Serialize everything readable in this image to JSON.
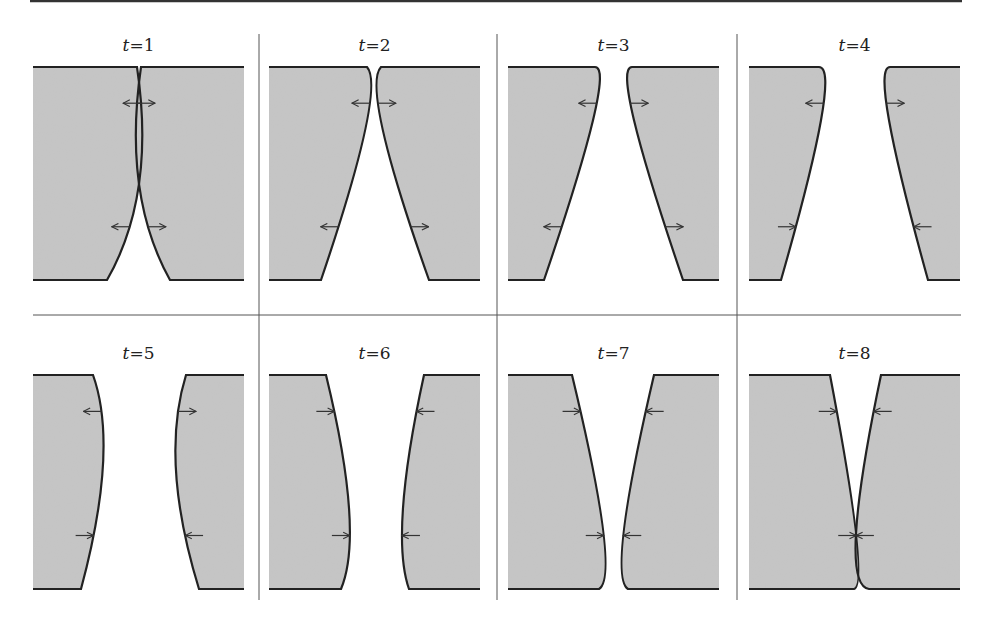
{
  "figure": {
    "colors": {
      "fill": "#c6c6c6",
      "stroke": "#222222",
      "rule": "#333333",
      "divider": "#555555"
    },
    "top_rule": {
      "x1": 30,
      "x2": 962,
      "y": 1
    },
    "h_divider": {
      "x1": 33,
      "x2": 961,
      "y": 315
    },
    "v_dividers": [
      {
        "x": 259,
        "y1": 34,
        "y2": 600
      },
      {
        "x": 497,
        "y1": 34,
        "y2": 600
      },
      {
        "x": 737,
        "y1": 34,
        "y2": 600
      }
    ],
    "panels": [
      {
        "label_var": "t",
        "label_val": "1",
        "col": 0,
        "row": 0,
        "left": {
          "top": 104,
          "mid": 106,
          "bot": 74,
          "midy": 0.55
        },
        "right": {
          "top": 108,
          "mid": 106,
          "bot": 137,
          "midy": 0.55
        },
        "arrows": [
          {
            "x": 106,
            "fy": 0.17,
            "l": "out",
            "r": "out"
          },
          {
            "fy": 0.75,
            "l": "out",
            "r": "out"
          }
        ]
      },
      {
        "label_var": "t",
        "label_val": "2",
        "col": 1,
        "row": 0,
        "left": {
          "top": 98,
          "mid": 96,
          "bot": 52,
          "midy": 0.3
        },
        "right": {
          "top": 112,
          "mid": 114,
          "bot": 160,
          "midy": 0.3
        },
        "arrows": [
          {
            "fy": 0.17,
            "l": "out",
            "r": "out"
          },
          {
            "fy": 0.75,
            "l": "out",
            "r": "out"
          }
        ]
      },
      {
        "label_var": "t",
        "label_val": "3",
        "col": 2,
        "row": 0,
        "left": {
          "top": 87,
          "mid": 85,
          "bot": 36,
          "midy": 0.25
        },
        "right": {
          "top": 124,
          "mid": 126,
          "bot": 175,
          "midy": 0.25
        },
        "arrows": [
          {
            "fy": 0.17,
            "l": "out",
            "r": "out"
          },
          {
            "fy": 0.75,
            "l": "out",
            "r": "out"
          }
        ]
      },
      {
        "label_var": "t",
        "label_val": "4",
        "col": 3,
        "row": 0,
        "left": {
          "top": 70,
          "mid": 72,
          "bot": 32,
          "midy": 0.25
        },
        "right": {
          "top": 141,
          "mid": 140,
          "bot": 179,
          "midy": 0.25
        },
        "arrows": [
          {
            "fy": 0.17,
            "l": "out",
            "r": "out"
          },
          {
            "fy": 0.75,
            "l": "in",
            "r": "in"
          }
        ]
      },
      {
        "label_var": "t",
        "label_val": "5",
        "col": 0,
        "row": 1,
        "left": {
          "top": 60,
          "mid": 70,
          "bot": 48,
          "midy": 0.42
        },
        "right": {
          "top": 153,
          "mid": 143,
          "bot": 166,
          "midy": 0.45
        },
        "arrows": [
          {
            "fy": 0.17,
            "l": "out",
            "r": "out"
          },
          {
            "fy": 0.75,
            "l": "in",
            "r": "in"
          }
        ]
      },
      {
        "label_var": "t",
        "label_val": "6",
        "col": 1,
        "row": 1,
        "left": {
          "top": 57,
          "mid": 80,
          "bot": 72,
          "midy": 0.62
        },
        "right": {
          "top": 155,
          "mid": 134,
          "bot": 140,
          "midy": 0.62
        },
        "arrows": [
          {
            "fy": 0.17,
            "l": "in",
            "r": "in"
          },
          {
            "fy": 0.75,
            "l": "in",
            "r": "in"
          }
        ]
      },
      {
        "label_var": "t",
        "label_val": "7",
        "col": 2,
        "row": 1,
        "left": {
          "top": 64,
          "mid": 95,
          "bot": 91,
          "midy": 0.72
        },
        "right": {
          "top": 146,
          "mid": 116,
          "bot": 120,
          "midy": 0.72
        },
        "arrows": [
          {
            "fy": 0.17,
            "l": "in",
            "r": "in"
          },
          {
            "fy": 0.75,
            "l": "in",
            "r": "in"
          }
        ]
      },
      {
        "label_var": "t",
        "label_val": "8",
        "col": 3,
        "row": 1,
        "left": {
          "top": 81,
          "mid": 107,
          "bot": 105,
          "midy": 0.74
        },
        "right": {
          "top": 132,
          "mid": 107,
          "bot": 120,
          "midy": 0.74
        },
        "arrows": [
          {
            "fy": 0.17,
            "l": "in",
            "r": "in"
          },
          {
            "fy": 0.75,
            "l": "in",
            "r": "in"
          }
        ]
      }
    ],
    "layout": {
      "col_x": [
        33,
        269,
        508,
        749
      ],
      "panel_w": 211,
      "rows": [
        {
          "top": 67,
          "bot": 280,
          "label_y": 51
        },
        {
          "top": 375,
          "bot": 589,
          "label_y": 359
        }
      ]
    }
  }
}
